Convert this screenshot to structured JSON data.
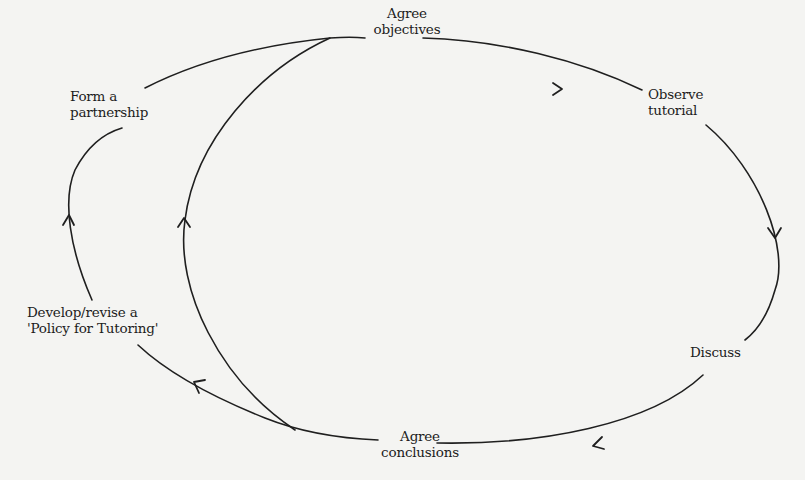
{
  "diagram": {
    "type": "cycle",
    "stroke_color": "#1f1f1f",
    "background_color": "#f4f4f2",
    "nodes": [
      {
        "id": "agree-objectives",
        "line1": "Agree",
        "line2": "objectives"
      },
      {
        "id": "observe-tutorial",
        "line1": "Observe",
        "line2": "tutorial"
      },
      {
        "id": "discuss",
        "line1": "Discuss"
      },
      {
        "id": "agree-conclusions",
        "line1": "Agree",
        "line2": "conclusions"
      },
      {
        "id": "develop-policy",
        "line1": "Develop/revise a",
        "line2": "'Policy for Tutoring'"
      },
      {
        "id": "form-partnership",
        "line1": "Form a",
        "line2": "partnership"
      }
    ],
    "edges": [
      {
        "from": "agree-objectives",
        "to": "observe-tutorial"
      },
      {
        "from": "observe-tutorial",
        "to": "discuss"
      },
      {
        "from": "discuss",
        "to": "agree-conclusions"
      },
      {
        "from": "agree-conclusions",
        "to": "develop-policy"
      },
      {
        "from": "develop-policy",
        "to": "form-partnership"
      },
      {
        "from": "form-partnership",
        "to": "agree-objectives"
      },
      {
        "from": "agree-conclusions",
        "to": "agree-objectives",
        "note": "inner shortcut loop"
      }
    ]
  }
}
